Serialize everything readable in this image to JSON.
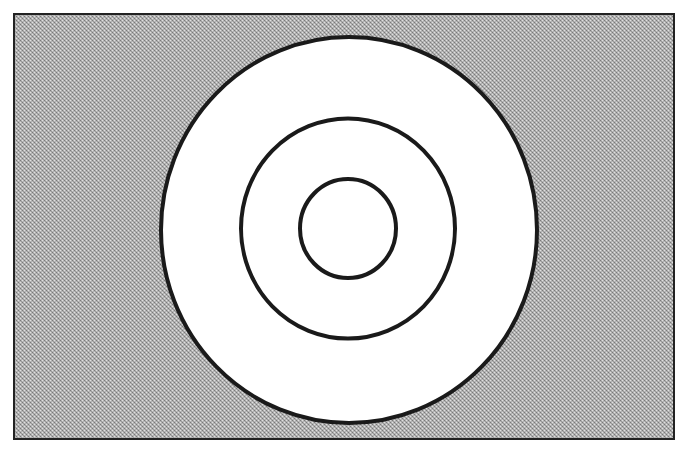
{
  "figure": {
    "type": "concentric-circles",
    "colors": {
      "background_fill": "#b0b0b0",
      "pattern_dark": "#8a8a8a",
      "pattern_light": "#d8d8d8",
      "circle_fill": "#ffffff",
      "stroke": "#1a1a1a",
      "frame_stroke": "#222222"
    },
    "frame": {
      "x": 13,
      "y": 13,
      "width": 662,
      "height": 427,
      "stroke_width": 2
    },
    "circles": [
      {
        "name": "outer",
        "cx": 349,
        "cy": 230,
        "rx": 188,
        "ry": 193,
        "stroke_width": 4
      },
      {
        "name": "middle",
        "cx": 348,
        "cy": 228.5,
        "rx": 107,
        "ry": 110,
        "stroke_width": 4
      },
      {
        "name": "inner",
        "cx": 348,
        "cy": 228.5,
        "rx": 48,
        "ry": 49.5,
        "stroke_width": 4
      }
    ]
  }
}
